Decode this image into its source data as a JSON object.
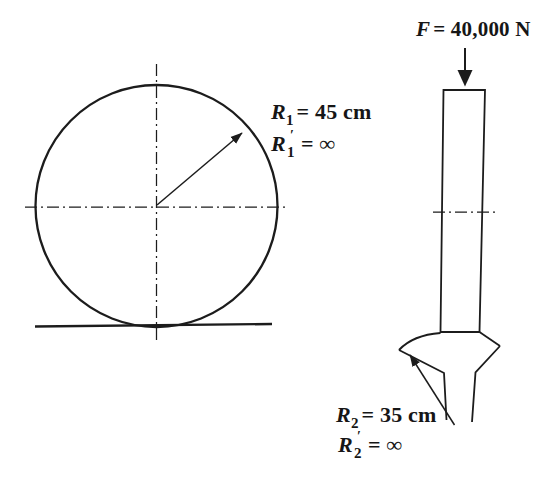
{
  "meta": {
    "ink_color": "#1c1c1c",
    "background_color": "#ffffff"
  },
  "cylinder": {
    "r1": {
      "symbol": "R",
      "sub": "1",
      "eq": "= 45 cm"
    },
    "r1_prime": {
      "symbol": "R",
      "sub": "1",
      "prime": "′",
      "eq": "= ∞"
    }
  },
  "rail": {
    "force": {
      "symbol": "F",
      "eq": "= 40,000 N"
    },
    "r2": {
      "symbol": "R",
      "sub": "2",
      "eq": "= 35 cm"
    },
    "r2_prime": {
      "symbol": "R",
      "sub": "2",
      "prime": "′",
      "eq": "= ∞"
    }
  }
}
